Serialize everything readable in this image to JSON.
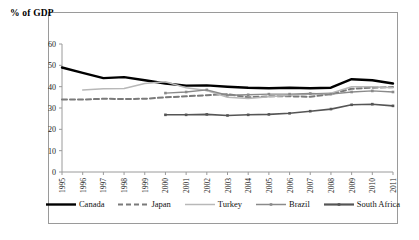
{
  "chart_data": {
    "type": "line",
    "title": "% of GDP",
    "xlabel": "",
    "ylabel": "",
    "ylim": [
      0,
      60
    ],
    "yticks": [
      0,
      10,
      20,
      30,
      40,
      50,
      60
    ],
    "grid": false,
    "legend_position": "bottom",
    "x": [
      1995,
      1996,
      1997,
      1998,
      1999,
      2000,
      2001,
      2002,
      2003,
      2004,
      2005,
      2006,
      2007,
      2008,
      2009,
      2010,
      2011
    ],
    "categories": [
      "1995",
      "1996",
      "1997",
      "1998",
      "1999",
      "2000",
      "2001",
      "2002",
      "2003",
      "2004",
      "2005",
      "2006",
      "2007",
      "2008",
      "2009",
      "2010",
      "2011"
    ],
    "series": [
      {
        "name": "Canada",
        "color": "#000000",
        "style": "solid-thick",
        "values": [
          49.0,
          46.5,
          44.0,
          44.5,
          43.0,
          41.5,
          40.5,
          40.6,
          40.0,
          39.5,
          39.3,
          39.5,
          39.3,
          39.5,
          43.5,
          43.0,
          41.5
        ]
      },
      {
        "name": "Japan",
        "color": "#7a7a7a",
        "style": "dashed",
        "values": [
          34.0,
          34.0,
          34.3,
          34.2,
          34.3,
          35.0,
          35.5,
          36.0,
          36.5,
          35.0,
          35.5,
          35.5,
          35.3,
          36.5,
          39.0,
          39.5,
          39.8
        ]
      },
      {
        "name": "Turkey",
        "color": "#b8b8b8",
        "style": "solid-thin",
        "values": [
          null,
          38.5,
          39.0,
          39.2,
          41.5,
          42.3,
          39.5,
          38.2,
          35.0,
          34.5,
          35.3,
          36.0,
          36.5,
          37.0,
          40.0,
          40.0,
          39.5
        ]
      },
      {
        "name": "Brazil",
        "color": "#8a8a8a",
        "style": "marker-thin",
        "values": [
          null,
          null,
          null,
          null,
          null,
          37.0,
          37.5,
          38.5,
          36.0,
          36.2,
          36.5,
          36.5,
          36.8,
          36.5,
          37.5,
          38.0,
          37.5
        ]
      },
      {
        "name": "South Africa",
        "color": "#555555",
        "style": "marker-thick",
        "values": [
          null,
          null,
          null,
          null,
          null,
          26.8,
          26.8,
          27.0,
          26.5,
          26.8,
          27.0,
          27.5,
          28.5,
          29.5,
          31.5,
          31.8,
          31.0
        ]
      }
    ]
  },
  "legend": {
    "items": [
      {
        "label": "Canada"
      },
      {
        "label": "Japan"
      },
      {
        "label": "Turkey"
      },
      {
        "label": "Brazil"
      },
      {
        "label": "South Africa"
      }
    ]
  }
}
